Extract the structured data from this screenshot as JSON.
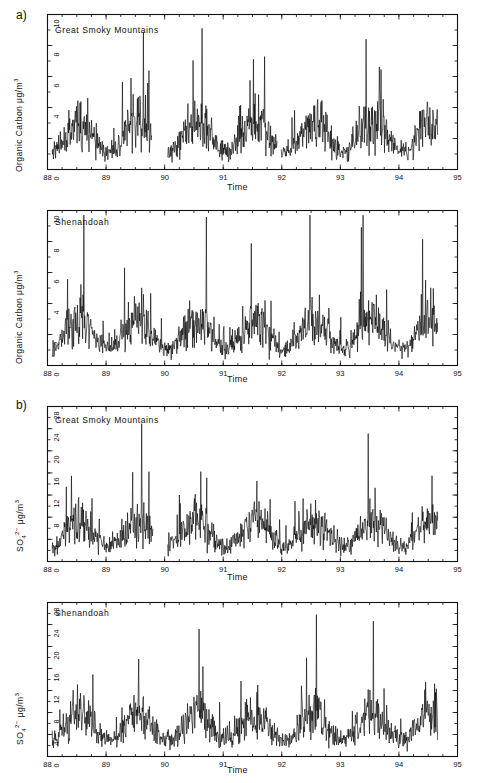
{
  "figure": {
    "panel_labels": [
      "a)",
      "b)"
    ],
    "xlabel": "Time",
    "site_names": [
      "Great Smoky Mountains",
      "Shenandoah"
    ]
  },
  "chart_data": [
    {
      "type": "line",
      "panel": "a)",
      "title": "Great Smoky Mountains",
      "xlabel": "Time",
      "ylabel": "Organic Carbon  μg/m³",
      "ylabel_base": "Organic Carbon",
      "ylabel_units": "μg/m",
      "ylabel_units_sup": "3",
      "xlim": [
        88,
        95
      ],
      "ylim": [
        0,
        10
      ],
      "xticks": [
        88,
        89,
        90,
        91,
        92,
        93,
        94,
        95
      ],
      "yticks": [
        0,
        2,
        4,
        6,
        8,
        10
      ],
      "grid": false,
      "legend": "none",
      "data_start": 88.08,
      "data_end": 94.66,
      "gaps": [
        [
          89.78,
          90.05
        ],
        [
          91.93,
          91.99
        ]
      ],
      "mean": 2.1,
      "seed": 11
    },
    {
      "type": "line",
      "panel": "a)",
      "title": "Shenandoah",
      "xlabel": "Time",
      "ylabel": "Organic Carbon  μg/m³",
      "ylabel_base": "Organic Carbon",
      "ylabel_units": "μg/m",
      "ylabel_units_sup": "3",
      "xlim": [
        88,
        95
      ],
      "ylim": [
        0,
        10
      ],
      "xticks": [
        88,
        89,
        90,
        91,
        92,
        93,
        94,
        95
      ],
      "yticks": [
        0,
        2,
        4,
        6,
        8,
        10
      ],
      "grid": false,
      "legend": "none",
      "data_start": 88.08,
      "data_end": 94.66,
      "gaps": [],
      "mean": 2.0,
      "seed": 29
    },
    {
      "type": "line",
      "panel": "b)",
      "title": "Great Smoky Mountains",
      "xlabel": "Time",
      "ylabel": "SO4(2-)  μg/m³",
      "ylabel_base": "SO",
      "ylabel_sub": "4",
      "ylabel_sup": "2−",
      "ylabel_units": "μg/m",
      "ylabel_units_sup": "3",
      "xlim": [
        88,
        95
      ],
      "ylim": [
        0,
        28
      ],
      "xticks": [
        88,
        89,
        90,
        91,
        92,
        93,
        94,
        95
      ],
      "yticks": [
        0,
        4,
        8,
        12,
        16,
        20,
        24,
        28
      ],
      "grid": false,
      "legend": "none",
      "data_start": 88.08,
      "data_end": 94.66,
      "gaps": [
        [
          89.8,
          90.04
        ]
      ],
      "mean": 5.0,
      "seed": 47
    },
    {
      "type": "line",
      "panel": "b)",
      "title": "Shenandoah",
      "xlabel": "Time",
      "ylabel": "SO4(2-)  μg/m³",
      "ylabel_base": "SO",
      "ylabel_sub": "4",
      "ylabel_sup": "2−",
      "ylabel_units": "μg/m",
      "ylabel_units_sup": "3",
      "xlim": [
        88,
        95
      ],
      "ylim": [
        0,
        28
      ],
      "xticks": [
        88,
        89,
        90,
        91,
        92,
        93,
        94,
        95
      ],
      "yticks": [
        0,
        4,
        8,
        12,
        16,
        20,
        24,
        28
      ],
      "grid": false,
      "legend": "none",
      "data_start": 88.08,
      "data_end": 94.66,
      "gaps": [],
      "mean": 5.4,
      "seed": 73
    }
  ]
}
